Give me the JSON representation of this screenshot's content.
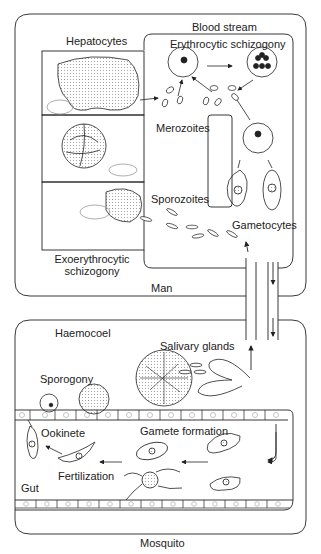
{
  "diagram": {
    "hosts": {
      "man": "Man",
      "mosquito": "Mosquito"
    },
    "man_regions": {
      "hepatocytes": "Hepatocytes",
      "blood_stream": "Blood stream",
      "erythrocytic": "Erythrocytic schizogony",
      "exo_line1": "Exoerythrocytic",
      "exo_line2": "schizogony"
    },
    "man_stages": {
      "merozoites": "Merozoites",
      "sporozoites": "Sporozoites",
      "gametocytes": "Gametocytes"
    },
    "mosquito_regions": {
      "haemocoel": "Haemocoel",
      "gut": "Gut"
    },
    "mosquito_stages": {
      "salivary_glands": "Salivary glands",
      "sporogony": "Sporogony",
      "ookinete": "Ookinete",
      "gamete_formation": "Gamete formation",
      "fertilization": "Fertilization"
    },
    "colors": {
      "line": "#222222",
      "background": "#ffffff",
      "stipple": "#888888"
    }
  }
}
